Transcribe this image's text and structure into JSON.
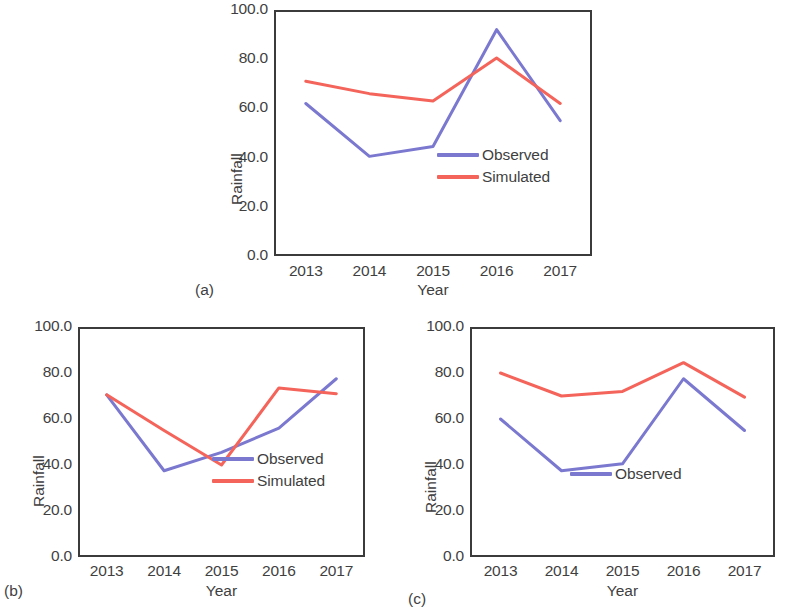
{
  "figure": {
    "series_colors": {
      "observed": "#7B78D0",
      "simulated": "#F4645A"
    },
    "axis_color": "#3b3b3b",
    "text_color": "#3f3f3f"
  },
  "chart_data": [
    {
      "id": "a",
      "type": "line",
      "panel_label": "(a)",
      "title": "",
      "xlabel": "Year",
      "ylabel": "Rainfall",
      "categories": [
        "2013",
        "2014",
        "2015",
        "2016",
        "2017"
      ],
      "x": [
        2013,
        2014,
        2015,
        2016,
        2017
      ],
      "ylim": [
        0,
        100
      ],
      "yticks": [
        "0.0",
        "20.0",
        "40.0",
        "60.0",
        "80.0",
        "100.0"
      ],
      "ytick_values": [
        0,
        20,
        40,
        60,
        80,
        100
      ],
      "grid": false,
      "legend_position": "center-right-inside",
      "series": [
        {
          "name": "Observed",
          "color": "#7B78D0",
          "values": [
            62.0,
            40.5,
            44.5,
            92.0,
            55.0
          ]
        },
        {
          "name": "Simulated",
          "color": "#F4645A",
          "values": [
            71.0,
            66.0,
            63.0,
            80.5,
            62.0
          ]
        }
      ],
      "legend_entries": [
        "Observed",
        "Simulated"
      ]
    },
    {
      "id": "b",
      "type": "line",
      "panel_label": "(b)",
      "title": "",
      "xlabel": "Year",
      "ylabel": "Rainfall",
      "categories": [
        "2013",
        "2014",
        "2015",
        "2016",
        "2017"
      ],
      "x": [
        2013,
        2014,
        2015,
        2016,
        2017
      ],
      "ylim": [
        0,
        100
      ],
      "yticks": [
        "0.0",
        "20.0",
        "40.0",
        "60.0",
        "80.0",
        "100.0"
      ],
      "ytick_values": [
        0,
        20,
        40,
        60,
        80,
        100
      ],
      "grid": false,
      "legend_position": "lower-right-inside",
      "series": [
        {
          "name": "Observed",
          "color": "#7B78D0",
          "values": [
            70.5,
            37.5,
            45.5,
            56.0,
            77.5
          ]
        },
        {
          "name": "Simulated",
          "color": "#F4645A",
          "values": [
            70.5,
            55.0,
            40.0,
            73.5,
            71.0
          ]
        }
      ],
      "legend_entries": [
        "Observed",
        "Simulated"
      ]
    },
    {
      "id": "c",
      "type": "line",
      "panel_label": "(c)",
      "title": "",
      "xlabel": "Year",
      "ylabel": "Rainfall",
      "categories": [
        "2013",
        "2014",
        "2015",
        "2016",
        "2017"
      ],
      "x": [
        2013,
        2014,
        2015,
        2016,
        2017
      ],
      "ylim": [
        0,
        100
      ],
      "yticks": [
        "0.0",
        "20.0",
        "40.0",
        "60.0",
        "80.0",
        "100.0"
      ],
      "ytick_values": [
        0,
        20,
        40,
        60,
        80,
        100
      ],
      "grid": false,
      "legend_position": "center-right-inside",
      "series": [
        {
          "name": "Observed",
          "color": "#7B78D0",
          "values": [
            60.0,
            37.5,
            40.5,
            77.5,
            55.0
          ]
        },
        {
          "name": "Simulated",
          "color": "#F4645A",
          "values": [
            80.0,
            70.0,
            72.0,
            84.5,
            69.5
          ]
        }
      ],
      "legend_entries": [
        "Observed"
      ]
    }
  ]
}
